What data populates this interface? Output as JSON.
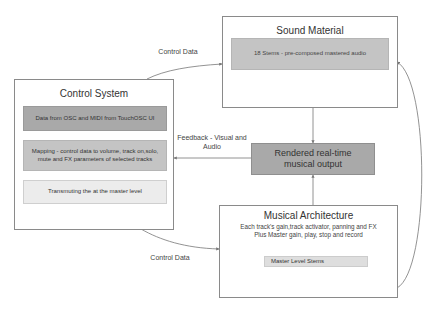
{
  "diagram": {
    "nodes": {
      "sound_material": {
        "title": "Sound Material",
        "items": [
          "18 Stems - pre-composed mastered audio"
        ]
      },
      "control_system": {
        "title": "Control System",
        "items": [
          "Data from OSC and MIDI from TouchOSC UI",
          "Mapping - control data to volume, track on,solo, mute and FX parameters of selected tracks",
          "Transmuting the at the master level"
        ]
      },
      "rendered_output": {
        "title": "Rendered real-time musical output"
      },
      "musical_architecture": {
        "title": "Musical Architecture",
        "description_line1": "Each track's gain,track activator, panning and FX",
        "description_line2": "Plus Master gain, play, stop and record",
        "items": [
          "Master Level Stems"
        ]
      }
    },
    "edges": {
      "control_to_sound": "Control Data",
      "control_to_architecture": "Control Data",
      "feedback": "Feedback - Visual and Audio"
    },
    "colors": {
      "dark_gray": "#a9a9a9",
      "mid_gray": "#c4c4c4",
      "light_gray": "#ececec",
      "border": "#8a8a8a"
    }
  }
}
